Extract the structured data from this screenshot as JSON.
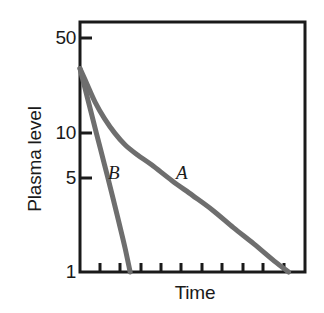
{
  "figure": {
    "background": "#ffffff",
    "frame_color": "#1a1a1a",
    "curve_color": "#6e6e6e",
    "text_color": "#1a1a1a"
  },
  "axes": {
    "y_label": "Plasma level",
    "x_label": "Time",
    "y_ticks": [
      {
        "id": "50",
        "label": "50",
        "value": 50
      },
      {
        "id": "10",
        "label": "10",
        "value": 10
      },
      {
        "id": "5",
        "label": "5",
        "value": 5
      },
      {
        "id": "1",
        "label": "1",
        "value": 1
      }
    ],
    "y_scale": "log",
    "x_scale": "linear",
    "x_tick_labels": [],
    "x_tick_count": 11,
    "grid": false
  },
  "annotations": [
    {
      "id": "A",
      "label": "A",
      "x": 176,
      "y": 163
    },
    {
      "id": "B",
      "label": "B",
      "x": 108,
      "y": 163
    }
  ],
  "chart_data": {
    "type": "line",
    "title": "",
    "subtitle": "",
    "xlabel": "Time",
    "ylabel": "Plasma level",
    "yscale": "log",
    "ylim": [
      1,
      60
    ],
    "xlim": [
      0,
      11
    ],
    "ytick_values": [
      1,
      5,
      10,
      50
    ],
    "ytick_labels": [
      "1",
      "5",
      "10",
      "50"
    ],
    "xtick_values": [
      0,
      1,
      2,
      3,
      4,
      5,
      6,
      7,
      8,
      9,
      10
    ],
    "xtick_labels": [
      "",
      "",
      "",
      "",
      "",
      "",
      "",
      "",
      "",
      "",
      ""
    ],
    "grid": false,
    "legend": "inline-annotations",
    "series": [
      {
        "name": "A",
        "annotation": "A",
        "shape": "biexponential-decay",
        "color": "#6e6e6e",
        "points": [
          {
            "x": 0.0,
            "y": 30.0
          },
          {
            "x": 0.35,
            "y": 23.0
          },
          {
            "x": 0.75,
            "y": 17.0
          },
          {
            "x": 1.2,
            "y": 13.0
          },
          {
            "x": 1.7,
            "y": 10.2
          },
          {
            "x": 2.2,
            "y": 8.4
          },
          {
            "x": 2.8,
            "y": 7.1
          },
          {
            "x": 3.5,
            "y": 6.0
          },
          {
            "x": 4.5,
            "y": 4.6
          },
          {
            "x": 5.5,
            "y": 3.6
          },
          {
            "x": 6.5,
            "y": 2.8
          },
          {
            "x": 7.5,
            "y": 2.1
          },
          {
            "x": 8.5,
            "y": 1.6
          },
          {
            "x": 9.5,
            "y": 1.2
          },
          {
            "x": 10.2,
            "y": 1.0
          }
        ]
      },
      {
        "name": "B",
        "annotation": "B",
        "shape": "monoexponential-decay",
        "color": "#6e6e6e",
        "points": [
          {
            "x": 0.0,
            "y": 30.0
          },
          {
            "x": 0.4,
            "y": 17.5
          },
          {
            "x": 0.8,
            "y": 10.2
          },
          {
            "x": 1.2,
            "y": 6.0
          },
          {
            "x": 1.6,
            "y": 3.5
          },
          {
            "x": 1.9,
            "y": 2.3
          },
          {
            "x": 2.2,
            "y": 1.5
          },
          {
            "x": 2.45,
            "y": 1.0
          }
        ]
      }
    ]
  }
}
